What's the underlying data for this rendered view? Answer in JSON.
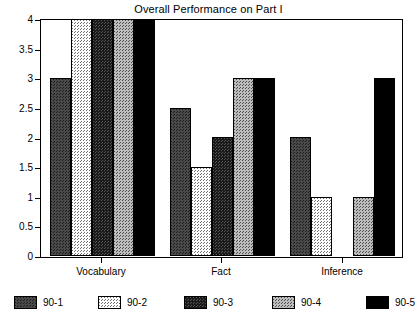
{
  "chart_data": {
    "type": "bar",
    "title": "Overall Performance on Part I",
    "clipped_title_above": "Student Profile",
    "xlabel": "",
    "ylabel": "",
    "categories": [
      "Vocabulary",
      "Fact",
      "Inference"
    ],
    "series": [
      {
        "name": "90-1",
        "pattern": "medium-dark-dither",
        "values": [
          3,
          2.5,
          2
        ]
      },
      {
        "name": "90-2",
        "pattern": "light-dither",
        "values": [
          4,
          1.5,
          1
        ]
      },
      {
        "name": "90-3",
        "pattern": "dark-dither",
        "values": [
          4,
          2,
          0
        ]
      },
      {
        "name": "90-4",
        "pattern": "medium-light-dither",
        "values": [
          4,
          3,
          1
        ]
      },
      {
        "name": "90-5",
        "pattern": "solid-black",
        "values": [
          4,
          3,
          3
        ]
      }
    ],
    "ylim": [
      0,
      4
    ],
    "ytick_labels": [
      "0",
      "0.5",
      "1",
      "1.5",
      "2",
      "2.5",
      "3",
      "3.5",
      "4"
    ],
    "ytick_values": [
      0,
      0.5,
      1,
      1.5,
      2,
      2.5,
      3,
      3.5,
      4
    ],
    "grid": false,
    "legend_position": "bottom",
    "colors": {
      "axis": "#000000",
      "background": "#ffffff",
      "series_90_1": "#4a4a4a",
      "series_90_2": "#e8e8e8",
      "series_90_3": "#1a1a1a",
      "series_90_4": "#bdbdbd",
      "series_90_5": "#000000"
    }
  },
  "legend": {
    "items": [
      {
        "label": "90-1"
      },
      {
        "label": "90-2"
      },
      {
        "label": "90-3"
      },
      {
        "label": "90-4"
      },
      {
        "label": "90-5"
      }
    ]
  }
}
